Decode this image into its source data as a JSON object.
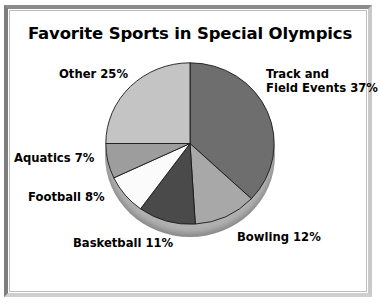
{
  "chart_data": {
    "type": "pie",
    "title": "Favorite Sports in Special Olympics",
    "xlabel": "",
    "ylabel": "",
    "legend_position": "none",
    "grid": false,
    "start_angle_deg": 0,
    "direction": "clockwise",
    "categories": [
      "Track and Field Events",
      "Bowling",
      "Basketball",
      "Football",
      "Aquatics",
      "Other"
    ],
    "values": [
      37,
      12,
      11,
      8,
      7,
      25
    ],
    "unit": "%",
    "total": 100,
    "slices": [
      {
        "name": "Track and Field Events",
        "value": 37,
        "label": "Track and\nField Events 37%",
        "color": "#6e6e6e"
      },
      {
        "name": "Bowling",
        "value": 12,
        "label": "Bowling 12%",
        "color": "#a8a8a8"
      },
      {
        "name": "Basketball",
        "value": 11,
        "label": "Basketball 11%",
        "color": "#4a4a4a"
      },
      {
        "name": "Football",
        "value": 8,
        "label": "Football 8%",
        "color": "#fbfbfb"
      },
      {
        "name": "Aquatics",
        "value": 7,
        "label": "Aquatics 7%",
        "color": "#9d9d9d"
      },
      {
        "name": "Other",
        "value": 25,
        "label": "Other 25%",
        "color": "#c4c4c4"
      }
    ]
  },
  "labels": {
    "track_line1": "Track and",
    "track_line2": "Field Events 37%",
    "other": "Other 25%",
    "aquatics": "Aquatics 7%",
    "football": "Football 8%",
    "basketball": "Basketball 11%",
    "bowling": "Bowling 12%"
  },
  "colors": {
    "track": "#6e6e6e",
    "bowling": "#a8a8a8",
    "basketball": "#4a4a4a",
    "football": "#fbfbfb",
    "aquatics": "#9d9d9d",
    "other": "#c4c4c4",
    "depth": "#b0b0b0",
    "outline": "#1a1a1a",
    "frame": "#7e7e7e",
    "text": "#000000"
  }
}
